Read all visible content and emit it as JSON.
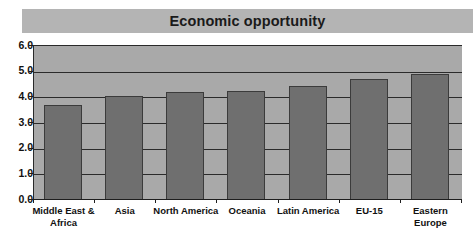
{
  "chart_data": {
    "type": "bar",
    "title": "Economic opportunity",
    "xlabel": "",
    "ylabel": "",
    "ylim": [
      0.0,
      6.0
    ],
    "ytick_step": 1.0,
    "grid": true,
    "legend": "none",
    "categories": [
      "Middle East &\nAfrica",
      "Asia",
      "North America",
      "Oceania",
      "Latin America",
      "EU-15",
      "Eastern\nEurope"
    ],
    "values": [
      3.7,
      4.05,
      4.2,
      4.25,
      4.45,
      4.7,
      4.9
    ],
    "ytick_labels": [
      "0.0",
      "1.0",
      "2.0",
      "3.0",
      "4.0",
      "5.0",
      "6.0"
    ],
    "colors": {
      "bar_fill": "#6f6f6f",
      "bar_border": "#3b3b3b",
      "plot_background": "#a9a9a9",
      "title_background": "#b4b4b4",
      "gridline": "#2b2b2b",
      "text": "#111111",
      "page_background": "#ffffff"
    }
  }
}
